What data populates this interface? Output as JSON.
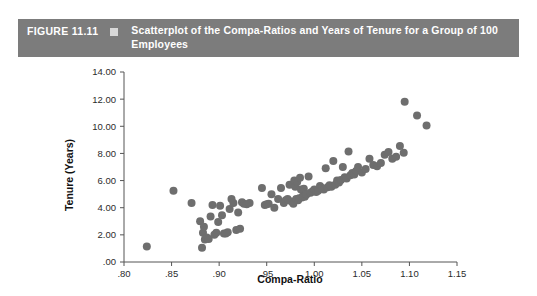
{
  "figure": {
    "number_label": "FIGURE 11.11",
    "bullet_icon": "square-bullet-icon",
    "caption": "Scatterplot of the Compa-Ratios and Years of Tenure for a Group of 100 Employees"
  },
  "colors": {
    "banner_background": "#7c7c7c",
    "banner_text": "#ffffff",
    "bullet": "#d8d8d8",
    "point": "#6e6e6e",
    "axis": "#555555",
    "page_background": "#ffffff"
  },
  "chart_data": {
    "type": "scatter",
    "title": "Scatterplot of the Compa-Ratios and Years of Tenure for a Group of 100 Employees",
    "xlabel": "Compa-Ratio",
    "ylabel": "Tenure (Years)",
    "xlim": [
      0.8,
      1.15
    ],
    "ylim": [
      0.0,
      14.0
    ],
    "xticks": [
      0.8,
      0.85,
      0.9,
      0.95,
      1.0,
      1.05,
      1.1,
      1.15
    ],
    "xticklabels": [
      ".80",
      ".85",
      ".90",
      ".95",
      "1.00",
      "1.05",
      "1.10",
      "1.15"
    ],
    "yticks": [
      0.0,
      2.0,
      4.0,
      6.0,
      8.0,
      10.0,
      12.0,
      14.0
    ],
    "yticklabels": [
      ".00",
      "2.00",
      "4.00",
      "6.00",
      "8.00",
      "10.00",
      "12.00",
      "14.00"
    ],
    "grid": false,
    "legend": null,
    "n_points": 100,
    "marker": "circle",
    "marker_color": "#6e6e6e",
    "marker_size": 5.2,
    "x": [
      0.824,
      0.852,
      0.871,
      0.88,
      0.882,
      0.883,
      0.884,
      0.885,
      0.887,
      0.889,
      0.891,
      0.893,
      0.895,
      0.897,
      0.899,
      0.901,
      0.903,
      0.905,
      0.907,
      0.909,
      0.911,
      0.913,
      0.915,
      0.918,
      0.92,
      0.922,
      0.924,
      0.926,
      0.929,
      0.932,
      0.945,
      0.948,
      0.95,
      0.952,
      0.955,
      0.958,
      0.962,
      0.965,
      0.968,
      0.97,
      0.972,
      0.974,
      0.976,
      0.978,
      0.979,
      0.98,
      0.981,
      0.982,
      0.983,
      0.984,
      0.985,
      0.986,
      0.987,
      0.988,
      0.989,
      0.99,
      0.991,
      0.992,
      0.994,
      0.996,
      0.998,
      1.0,
      1.002,
      1.004,
      1.006,
      1.008,
      1.01,
      1.012,
      1.014,
      1.016,
      1.018,
      1.02,
      1.022,
      1.024,
      1.026,
      1.028,
      1.03,
      1.032,
      1.034,
      1.036,
      1.038,
      1.04,
      1.042,
      1.044,
      1.046,
      1.05,
      1.054,
      1.058,
      1.062,
      1.066,
      1.07,
      1.074,
      1.078,
      1.082,
      1.086,
      1.09,
      1.094,
      1.095,
      1.108,
      1.118
    ],
    "y": [
      1.15,
      5.25,
      4.35,
      3.0,
      1.05,
      2.15,
      2.6,
      1.65,
      1.8,
      1.7,
      3.35,
      4.2,
      2.0,
      2.15,
      2.95,
      4.15,
      3.45,
      2.1,
      2.1,
      2.2,
      3.9,
      4.65,
      4.35,
      2.35,
      3.65,
      2.45,
      4.4,
      4.3,
      4.25,
      4.35,
      5.45,
      4.2,
      4.25,
      4.3,
      5.0,
      4.0,
      4.65,
      5.45,
      4.35,
      4.55,
      4.65,
      5.7,
      4.45,
      4.3,
      6.0,
      5.55,
      4.65,
      5.9,
      4.55,
      4.7,
      6.2,
      5.35,
      4.75,
      4.85,
      5.4,
      4.8,
      4.95,
      5.0,
      6.3,
      5.1,
      5.2,
      5.35,
      5.15,
      5.25,
      5.6,
      5.45,
      5.35,
      6.9,
      5.5,
      5.65,
      5.55,
      7.45,
      5.7,
      6.0,
      5.85,
      6.05,
      7.0,
      6.25,
      6.15,
      8.15,
      6.4,
      6.55,
      6.45,
      6.7,
      7.0,
      6.6,
      6.85,
      7.6,
      7.15,
      7.05,
      7.3,
      7.9,
      8.1,
      7.6,
      7.75,
      8.55,
      8.05,
      11.8,
      10.8,
      10.05
    ]
  },
  "axis_titles": {
    "x": "Compa-Ratio",
    "y": "Tenure (Years)"
  }
}
